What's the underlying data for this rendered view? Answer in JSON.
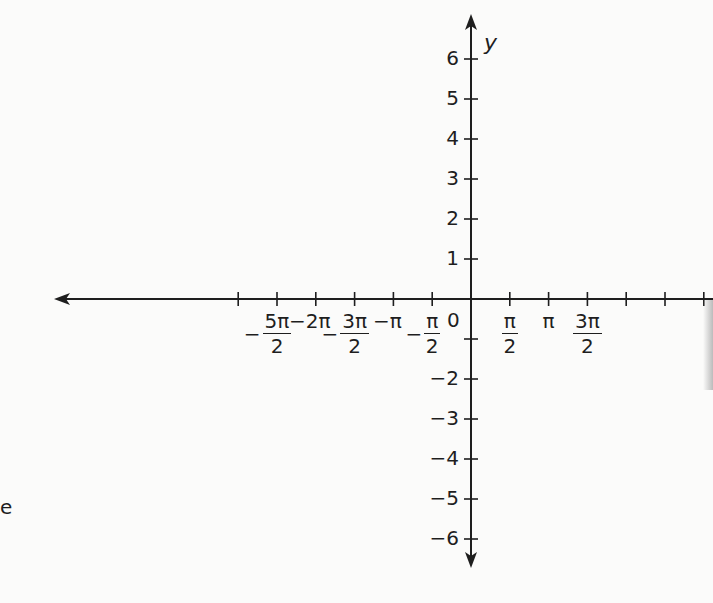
{
  "diagram": {
    "type": "coordinate-axes",
    "axis_color": "#1e1e1e",
    "origin_px": [
      471,
      299
    ],
    "x_unit_px": 38.8,
    "y_unit_px": 40,
    "y_axis_name": "y",
    "origin_label": "0",
    "x_tick_count_each_side": 6,
    "y_ticks": [
      {
        "value": 6,
        "label": "6"
      },
      {
        "value": 5,
        "label": "5"
      },
      {
        "value": 4,
        "label": "4"
      },
      {
        "value": 3,
        "label": "3"
      },
      {
        "value": 2,
        "label": "2"
      },
      {
        "value": 1,
        "label": "1"
      },
      {
        "value": -1,
        "label": ""
      },
      {
        "value": -2,
        "label": "−2"
      },
      {
        "value": -3,
        "label": "−3"
      },
      {
        "value": -4,
        "label": "−4"
      },
      {
        "value": -5,
        "label": "−5"
      },
      {
        "value": -6,
        "label": "−6"
      }
    ],
    "x_labels": [
      {
        "pos": -5,
        "neg": "−",
        "num": "5π",
        "den": "2"
      },
      {
        "pos": -4,
        "text": "−2π"
      },
      {
        "pos": -3,
        "neg": "−",
        "num": "3π",
        "den": "2"
      },
      {
        "pos": -2,
        "text": "−π"
      },
      {
        "pos": -1,
        "neg": "−",
        "num": "π",
        "den": "2"
      },
      {
        "pos": 1,
        "neg": "",
        "num": "π",
        "den": "2"
      },
      {
        "pos": 2,
        "text": "π"
      },
      {
        "pos": 3,
        "neg": "",
        "num": "3π",
        "den": "2"
      }
    ],
    "left_fragment": "e"
  }
}
